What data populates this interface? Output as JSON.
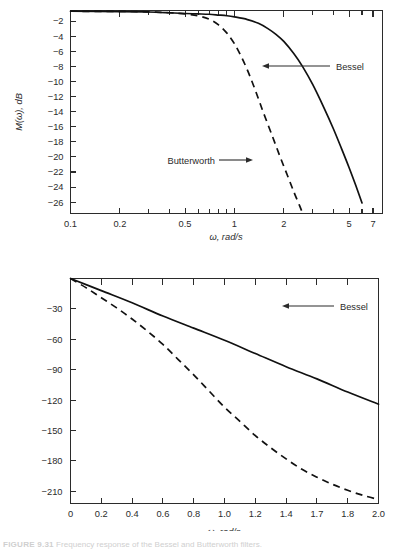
{
  "figure": {
    "caption_label": "FIGURE 9.31",
    "caption_text": "Frequency response of the Bessel and Butterworth filters."
  },
  "charts": [
    {
      "id": "magnitude",
      "title": "",
      "type": "line",
      "xlabel": "ω, rad/s",
      "ylabel": "M(ω), dB",
      "xscale": "log",
      "xlim": [
        0.1,
        8.0
      ],
      "ylim": [
        -27.5,
        -0.6
      ],
      "grid": false,
      "x_tick_labels": [
        "0.1",
        "0.2",
        "0.5",
        "1",
        "2",
        "5",
        "7"
      ],
      "x_tick_values": [
        0.1,
        0.2,
        0.5,
        1,
        2,
        5,
        7
      ],
      "x_minor_ticks": [
        0.3,
        0.4,
        0.6,
        0.7,
        0.8,
        0.9,
        3,
        4,
        6
      ],
      "y_tick_labels": [
        "-2",
        "-4",
        "-6",
        "-8",
        "-10",
        "-12",
        "-14",
        "-16",
        "-18",
        "-20",
        "-22",
        "-24",
        "-26"
      ],
      "y_tick_values": [
        -2,
        -4,
        -6,
        -8,
        -10,
        -12,
        -14,
        -16,
        -18,
        -20,
        -22,
        -24,
        -26
      ],
      "series": [
        {
          "name": "Bessel",
          "style": "solid",
          "label": "Bessel",
          "x": [
            0.1,
            0.2,
            0.3,
            0.4,
            0.5,
            0.6,
            0.7,
            0.8,
            0.9,
            1.0,
            1.2,
            1.4,
            1.6,
            1.8,
            2.0,
            2.3,
            2.6,
            3.0,
            3.5,
            4.0,
            4.5,
            5.0,
            5.5,
            6.0
          ],
          "y": [
            -0.7,
            -0.75,
            -0.8,
            -0.9,
            -1.0,
            -1.05,
            -1.1,
            -1.2,
            -1.3,
            -1.45,
            -1.8,
            -2.3,
            -3.0,
            -3.8,
            -4.7,
            -6.3,
            -8.0,
            -10.4,
            -13.4,
            -16.2,
            -18.9,
            -21.4,
            -23.8,
            -26.1
          ]
        },
        {
          "name": "Butterworth",
          "style": "dashed",
          "label": "Butterworth",
          "x": [
            0.1,
            0.2,
            0.3,
            0.4,
            0.5,
            0.6,
            0.7,
            0.8,
            0.9,
            1.0,
            1.1,
            1.2,
            1.3,
            1.4,
            1.5,
            1.7,
            1.9,
            2.1,
            2.3,
            2.5,
            2.6
          ],
          "y": [
            -0.7,
            -0.72,
            -0.78,
            -0.9,
            -1.05,
            -1.3,
            -1.75,
            -2.5,
            -3.6,
            -5.0,
            -6.7,
            -8.5,
            -10.4,
            -12.3,
            -14.1,
            -17.2,
            -20.0,
            -22.4,
            -24.6,
            -26.5,
            -27.4
          ]
        }
      ],
      "annotations": [
        {
          "text": "Bessel",
          "side": "right"
        },
        {
          "text": "Butterworth",
          "side": "left"
        }
      ]
    },
    {
      "id": "phase",
      "title": "",
      "type": "line",
      "xlabel": "ω, rad/s",
      "ylabel": "φ(ω), deg",
      "xscale": "linear",
      "xlim": [
        0.0,
        2.0
      ],
      "ylim": [
        -222,
        0
      ],
      "grid": false,
      "x_tick_labels": [
        "0",
        "0.2",
        "0.4",
        "0.6",
        "0.8",
        "1.0",
        "1.2",
        "1.4",
        "1.7",
        "1.8",
        "2.0"
      ],
      "x_tick_values": [
        0,
        0.2,
        0.4,
        0.6,
        0.8,
        1.0,
        1.2,
        1.4,
        1.6,
        1.8,
        2.0
      ],
      "y_tick_labels": [
        "-30",
        "-60",
        "-90",
        "-120",
        "-150",
        "-180",
        "-210"
      ],
      "y_tick_values": [
        -30,
        -60,
        -90,
        -120,
        -150,
        -180,
        -210
      ],
      "series": [
        {
          "name": "Bessel",
          "style": "solid",
          "label": "Bessel",
          "x": [
            0.0,
            0.2,
            0.4,
            0.6,
            0.8,
            1.0,
            1.2,
            1.4,
            1.6,
            1.8,
            2.0
          ],
          "y": [
            0,
            -12,
            -24,
            -37,
            -49,
            -61,
            -74,
            -87,
            -99,
            -112,
            -124
          ]
        },
        {
          "name": "Butterworth",
          "style": "dashed",
          "label": "Butterworth",
          "x": [
            0.0,
            0.1,
            0.2,
            0.3,
            0.4,
            0.5,
            0.6,
            0.7,
            0.8,
            0.9,
            1.0,
            1.1,
            1.2,
            1.3,
            1.4,
            1.5,
            1.6,
            1.7,
            1.8,
            1.9,
            2.0
          ],
          "y": [
            0,
            -9,
            -19,
            -29,
            -40,
            -52,
            -65,
            -80,
            -95,
            -111,
            -127,
            -141,
            -155,
            -167,
            -178,
            -188,
            -196,
            -203,
            -209,
            -214,
            -218
          ]
        }
      ],
      "annotations": [
        {
          "text": "Bessel",
          "side": "right"
        },
        {
          "text": "Butterworth",
          "side": "right"
        }
      ]
    }
  ],
  "chart_data": [
    {
      "type": "line",
      "title": "Magnitude response of Bessel and Butterworth filters",
      "xlabel": "ω, rad/s",
      "ylabel": "M(ω), dB",
      "xscale": "log",
      "xlim": [
        0.1,
        8.0
      ],
      "ylim": [
        -27.5,
        -0.6
      ],
      "grid": false,
      "legend_position": "inline-annotation",
      "x_tick_labels": [
        "0.1",
        "0.2",
        "0.5",
        "1",
        "2",
        "5",
        "7"
      ],
      "y_tick_labels": [
        "-2",
        "-4",
        "-6",
        "-8",
        "-10",
        "-12",
        "-14",
        "-16",
        "-18",
        "-20",
        "-22",
        "-24",
        "-26"
      ],
      "series": [
        {
          "name": "Bessel",
          "x": [
            0.1,
            0.2,
            0.3,
            0.4,
            0.5,
            0.6,
            0.7,
            0.8,
            0.9,
            1.0,
            1.2,
            1.4,
            1.6,
            1.8,
            2.0,
            2.3,
            2.6,
            3.0,
            3.5,
            4.0,
            4.5,
            5.0,
            5.5,
            6.0
          ],
          "values": [
            -0.7,
            -0.75,
            -0.8,
            -0.9,
            -1.0,
            -1.05,
            -1.1,
            -1.2,
            -1.3,
            -1.45,
            -1.8,
            -2.3,
            -3.0,
            -3.8,
            -4.7,
            -6.3,
            -8.0,
            -10.4,
            -13.4,
            -16.2,
            -18.9,
            -21.4,
            -23.8,
            -26.1
          ]
        },
        {
          "name": "Butterworth",
          "x": [
            0.1,
            0.2,
            0.3,
            0.4,
            0.5,
            0.6,
            0.7,
            0.8,
            0.9,
            1.0,
            1.1,
            1.2,
            1.3,
            1.4,
            1.5,
            1.7,
            1.9,
            2.1,
            2.3,
            2.5,
            2.6
          ],
          "values": [
            -0.7,
            -0.72,
            -0.78,
            -0.9,
            -1.05,
            -1.3,
            -1.75,
            -2.5,
            -3.6,
            -5.0,
            -6.7,
            -8.5,
            -10.4,
            -12.3,
            -14.1,
            -17.2,
            -20.0,
            -22.4,
            -24.6,
            -26.5,
            -27.4
          ]
        }
      ]
    },
    {
      "type": "line",
      "title": "Phase response of Bessel and Butterworth filters",
      "xlabel": "ω, rad/s",
      "ylabel": "φ(ω), deg",
      "xscale": "linear",
      "xlim": [
        0.0,
        2.0
      ],
      "ylim": [
        -222,
        0
      ],
      "grid": false,
      "legend_position": "inline-annotation",
      "x_tick_labels": [
        "0",
        "0.2",
        "0.4",
        "0.6",
        "0.8",
        "1.0",
        "1.2",
        "1.4",
        "1.7",
        "1.8",
        "2.0"
      ],
      "y_tick_labels": [
        "-30",
        "-60",
        "-90",
        "-120",
        "-150",
        "-180",
        "-210"
      ],
      "series": [
        {
          "name": "Bessel",
          "x": [
            0.0,
            0.2,
            0.4,
            0.6,
            0.8,
            1.0,
            1.2,
            1.4,
            1.6,
            1.8,
            2.0
          ],
          "values": [
            0,
            -12,
            -24,
            -37,
            -49,
            -61,
            -74,
            -87,
            -99,
            -112,
            -124
          ]
        },
        {
          "name": "Butterworth",
          "x": [
            0.0,
            0.1,
            0.2,
            0.3,
            0.4,
            0.5,
            0.6,
            0.7,
            0.8,
            0.9,
            1.0,
            1.1,
            1.2,
            1.3,
            1.4,
            1.5,
            1.6,
            1.7,
            1.8,
            1.9,
            2.0
          ],
          "values": [
            0,
            -9,
            -19,
            -29,
            -40,
            -52,
            -65,
            -80,
            -95,
            -111,
            -127,
            -141,
            -155,
            -167,
            -178,
            -188,
            -196,
            -203,
            -209,
            -214,
            -218
          ]
        }
      ]
    }
  ]
}
